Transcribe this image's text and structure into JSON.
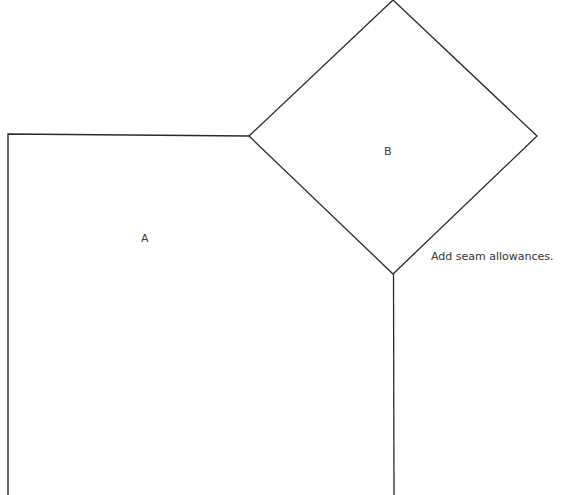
{
  "diagram": {
    "type": "quilt-template",
    "stroke_color": "#2a2a2a",
    "background": "#ffffff",
    "pieces": [
      {
        "id": "A",
        "label": "A",
        "shape": "rectangle-partial",
        "label_pos": {
          "x": 146,
          "y": 233
        },
        "points": [
          [
            8,
            495
          ],
          [
            8,
            134
          ],
          [
            249,
            136
          ],
          [
            393,
            274
          ],
          [
            394,
            495
          ]
        ]
      },
      {
        "id": "B",
        "label": "B",
        "shape": "diamond",
        "label_pos": {
          "x": 383,
          "y": 146
        },
        "points": [
          [
            393,
            0
          ],
          [
            537,
            136
          ],
          [
            393,
            274
          ],
          [
            249,
            136
          ]
        ]
      }
    ],
    "note": {
      "text": "Add seam allowances.",
      "pos": {
        "x": 431,
        "y": 251
      }
    }
  }
}
